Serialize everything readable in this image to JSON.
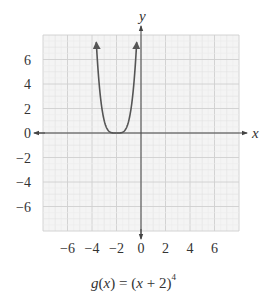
{
  "chart_data": {
    "type": "line",
    "function": "g(x) = (x + 2)^4",
    "xlabel": "x",
    "ylabel": "y",
    "xlim": [
      -8,
      8
    ],
    "ylim": [
      -8,
      8
    ],
    "x_ticks": [
      -6,
      -4,
      -2,
      0,
      2,
      4,
      6
    ],
    "y_ticks": [
      6,
      4,
      2,
      0,
      -2,
      -4,
      -6
    ],
    "x_tick_labels": [
      "−6",
      "−4",
      "−2",
      "0",
      "2",
      "4",
      "6"
    ],
    "y_tick_labels": [
      "6",
      "4",
      "2",
      "0",
      "−2",
      "−4",
      "−6"
    ],
    "grid": true,
    "grid_minor_step": 1,
    "grid_major_step": 2,
    "series": [
      {
        "name": "g(x)",
        "x": [
          -3.65,
          -3.5,
          -3.25,
          -3,
          -2.75,
          -2.5,
          -2.25,
          -2,
          -1.75,
          -1.5,
          -1.25,
          -1,
          -0.75,
          -0.5,
          -0.35
        ],
        "y": [
          7.41,
          5.06,
          2.44,
          1.0,
          0.32,
          0.06,
          0.004,
          0,
          0.004,
          0.06,
          0.32,
          1.0,
          2.44,
          5.06,
          7.41
        ],
        "end_arrows": true
      }
    ],
    "key_points": {
      "vertex": [
        -2,
        0
      ]
    },
    "colors": {
      "curve": "#555555",
      "axis": "#444444",
      "grid_minor": "#e2e2e2",
      "grid_major": "#cfcfcf",
      "grid_background": "#f4f4f4",
      "text": "#333333"
    }
  },
  "caption": {
    "fn_name": "g",
    "arg": "x",
    "equals": " = ",
    "open": "(",
    "inner": "x",
    "plus": " + 2",
    "close": ")",
    "exponent": "4"
  }
}
